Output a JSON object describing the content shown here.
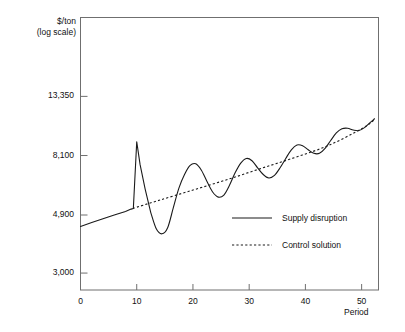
{
  "chart_data": {
    "type": "line",
    "title": "",
    "ylabel": "$/ton\n(log scale)",
    "ylabel_line1": "$/ton",
    "ylabel_line2": "(log scale)",
    "xlabel": "Period",
    "log_y": true,
    "grid": false,
    "legend_position": "inside-lower-center",
    "xlim": [
      0,
      53
    ],
    "ylim": [
      2600,
      26000
    ],
    "xticks": [
      0,
      10,
      20,
      30,
      40,
      50
    ],
    "xtick_labels": [
      "0",
      "10",
      "20",
      "30",
      "40",
      "50"
    ],
    "yticks": [
      3000,
      4900,
      8100,
      13350
    ],
    "ytick_labels": [
      "3,000",
      "4,900",
      "8,100",
      "13,350"
    ],
    "series": [
      {
        "name": "Supply disruption",
        "style": "solid",
        "color": "#1a1a1a",
        "x": [
          0,
          2,
          4,
          6,
          8,
          9,
          9.4,
          10,
          10.6,
          11.5,
          12.5,
          13.5,
          14.5,
          15.5,
          16.5,
          17.5,
          18.5,
          19.5,
          20.5,
          21.5,
          22.5,
          23.5,
          24.5,
          25.5,
          26.5,
          27.5,
          28.5,
          29.5,
          30.5,
          31.5,
          32.5,
          33.5,
          34.5,
          35.5,
          36.5,
          37.5,
          38.5,
          39.5,
          40.5,
          41.5,
          42.5,
          43.5,
          44.5,
          45.5,
          46.5,
          47.5,
          48.5,
          49.5,
          50.5,
          51.5,
          52.3
        ],
        "values": [
          4450,
          4600,
          4750,
          4900,
          5050,
          5150,
          5180,
          9100,
          7500,
          6100,
          5000,
          4350,
          4180,
          4400,
          5200,
          6150,
          6900,
          7450,
          7550,
          7150,
          6500,
          5950,
          5700,
          5800,
          6300,
          7000,
          7600,
          7900,
          7750,
          7300,
          6900,
          6700,
          6850,
          7300,
          7900,
          8500,
          8850,
          8800,
          8500,
          8250,
          8250,
          8600,
          9200,
          9800,
          10150,
          10200,
          10050,
          10000,
          10250,
          10700,
          11050
        ]
      },
      {
        "name": "Control solution",
        "style": "dotted",
        "color": "#1a1a1a",
        "x": [
          9.3,
          14,
          20,
          26,
          32,
          38,
          44,
          50,
          52.3
        ],
        "values": [
          5180,
          5550,
          6050,
          6600,
          7250,
          7950,
          8800,
          10150,
          10950
        ]
      }
    ],
    "legend": [
      {
        "label": "Supply disruption",
        "style": "solid"
      },
      {
        "label": "Control solution",
        "style": "dotted"
      }
    ]
  }
}
